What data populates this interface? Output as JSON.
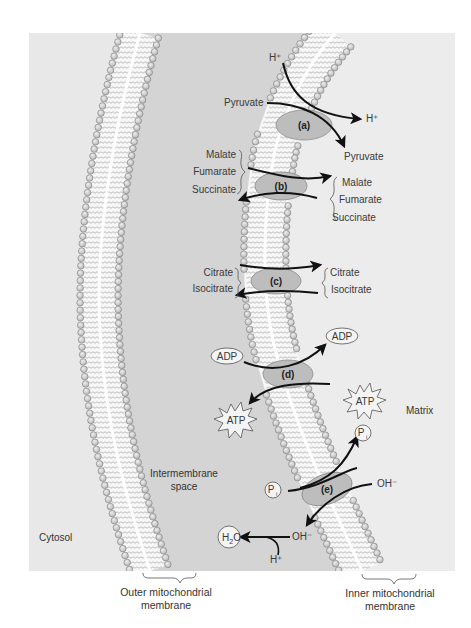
{
  "figure": {
    "regions": {
      "cytosol": "Cytosol",
      "intermembrane_space_line1": "Intermembrane",
      "intermembrane_space_line2": "space",
      "matrix": "Matrix"
    },
    "membranes": {
      "outer_line1": "Outer mitochondrial",
      "outer_line2": "membrane",
      "inner_line1": "Inner mitochondrial",
      "inner_line2": "membrane"
    },
    "transporters": [
      {
        "id": "a",
        "label": "(a)",
        "ims_side": [
          "H⁺",
          "Pyruvate"
        ],
        "matrix_side": [
          "H⁺",
          "Pyruvate"
        ]
      },
      {
        "id": "b",
        "label": "(b)",
        "ims_side": [
          "Malate",
          "Fumarate",
          "Succinate"
        ],
        "matrix_side": [
          "Malate",
          "Fumarate",
          "Succinate"
        ]
      },
      {
        "id": "c",
        "label": "(c)",
        "ims_side": [
          "Citrate",
          "Isocitrate"
        ],
        "matrix_side": [
          "Citrate",
          "Isocitrate"
        ]
      },
      {
        "id": "d",
        "label": "(d)",
        "ims_side": [
          "ADP",
          "ATP"
        ],
        "matrix_side": [
          "ADP",
          "ATP"
        ]
      },
      {
        "id": "e",
        "label": "(e)",
        "ims_side": [
          "P",
          "i",
          "OH⁻"
        ],
        "matrix_side": [
          "P",
          "i",
          "OH⁻"
        ]
      }
    ],
    "ims_reaction": {
      "product": "H",
      "product_sub": "2",
      "product_tail": "O",
      "reactant": "OH⁻",
      "cofactor": "H⁺"
    },
    "colors": {
      "panel_light": "#e6e6e6",
      "ims_band": "#cfcfcf",
      "bead_fill": "#c9c9c9",
      "bead_stroke": "#7d7d7d",
      "protein_fill": "#b9b9b9",
      "protein_stroke": "#8a8a8a",
      "arrow": "#111111"
    }
  }
}
